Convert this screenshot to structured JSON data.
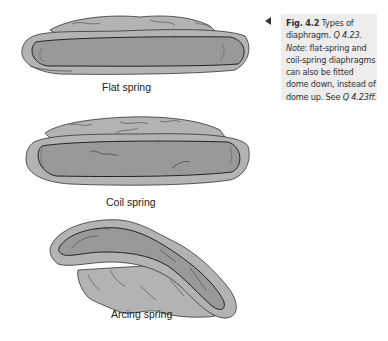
{
  "figure": {
    "items": [
      {
        "name": "flat-spring",
        "label": "Flat spring"
      },
      {
        "name": "coil-spring",
        "label": "Coil spring"
      },
      {
        "name": "arcing-spring",
        "label": "Arcing spring"
      }
    ],
    "colors": {
      "outer": "#b3b3b3",
      "inner": "#999999",
      "stroke": "#333333",
      "caption_bg": "#ededed"
    }
  },
  "caption": {
    "fig_label": "Fig. 4.2",
    "title_text": " Types of diaphragm. ",
    "q_ref": "Q 4.23.",
    "note_label": "Note",
    "note_text": ": flat-spring and coil-spring diaphragms can also be fitted dome down, instead of dome up. See ",
    "see_ref": "Q 4.23ff."
  }
}
